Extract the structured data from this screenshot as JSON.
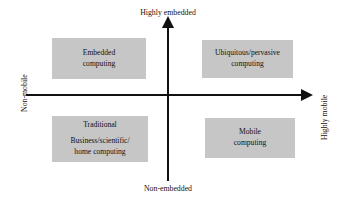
{
  "diagram": {
    "colors": {
      "box_fill": "#c6c6c6",
      "axis": "#111111",
      "background": "#ffffff",
      "text": "#111111"
    },
    "axes": {
      "vertical": {
        "top_label": "Highly embedded",
        "bottom_label": "Non-embedded"
      },
      "horizontal": {
        "left_label": "Non-mobile",
        "right_label": "Highly mobile"
      }
    },
    "quadrants": [
      {
        "key": "top_left",
        "name": "embedded-computing",
        "lines": [
          "Embedded",
          "computing"
        ]
      },
      {
        "key": "top_right",
        "name": "ubiquitous-pervasive-computing",
        "lines": [
          "Ubiquitous/pervasive",
          "computing"
        ]
      },
      {
        "key": "bottom_left",
        "name": "traditional-computing",
        "lines": [
          "Traditional",
          "Business/scientific/",
          "home computing"
        ]
      },
      {
        "key": "bottom_right",
        "name": "mobile-computing",
        "lines": [
          "Mobile",
          "computing"
        ]
      }
    ],
    "icons": {
      "arrow_up": "arrow-up-icon",
      "arrow_right": "arrow-right-icon"
    }
  }
}
